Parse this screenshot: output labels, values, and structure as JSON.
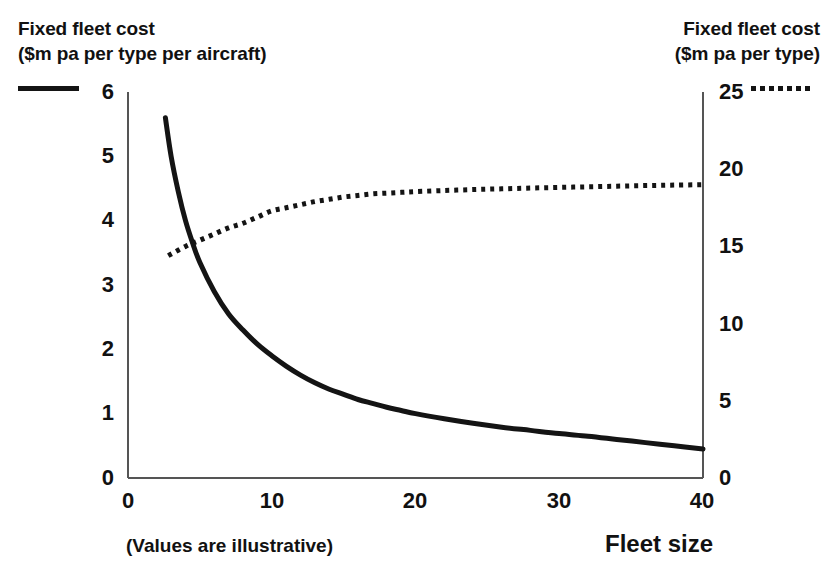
{
  "chart_data": {
    "type": "line",
    "title": "",
    "subtitle": "",
    "note": "(Values are illustrative)",
    "xlabel": "Fleet size",
    "xlim": [
      0,
      40
    ],
    "xticks": [
      0,
      10,
      20,
      30,
      40
    ],
    "grid": false,
    "legend_position": "top-outside",
    "axes": [
      {
        "id": "left",
        "side": "left",
        "label_line1": "Fixed fleet cost",
        "label_line2": "($m pa per type per aircraft)",
        "ylim": [
          0,
          6
        ],
        "yticks": [
          0,
          1,
          2,
          3,
          4,
          5,
          6
        ]
      },
      {
        "id": "right",
        "side": "right",
        "label_line1": "Fixed fleet cost",
        "label_line2": "($m pa per type)",
        "ylim": [
          0,
          25
        ],
        "yticks": [
          0,
          5,
          10,
          15,
          20,
          25
        ]
      }
    ],
    "series": [
      {
        "name": "Fixed fleet cost ($m pa per type per aircraft)",
        "axis": "left",
        "style": "solid",
        "color": "#141414",
        "x": [
          2.6,
          3,
          3.5,
          4,
          4.5,
          5,
          6,
          7,
          8,
          9,
          10,
          11,
          12,
          13,
          14,
          15,
          16,
          17,
          18,
          19,
          20,
          22,
          24,
          26,
          28,
          30,
          32,
          34,
          36,
          38,
          40
        ],
        "y": [
          5.6,
          5.0,
          4.45,
          4.0,
          3.65,
          3.35,
          2.9,
          2.55,
          2.3,
          2.08,
          1.9,
          1.74,
          1.6,
          1.48,
          1.38,
          1.3,
          1.22,
          1.16,
          1.1,
          1.05,
          1.0,
          0.92,
          0.85,
          0.79,
          0.74,
          0.69,
          0.65,
          0.6,
          0.55,
          0.5,
          0.45
        ]
      },
      {
        "name": "Fixed fleet cost ($m pa per type)",
        "axis": "right",
        "style": "dotted",
        "color": "#141414",
        "x": [
          2.8,
          4,
          5,
          6,
          7,
          8,
          9,
          10,
          11,
          12,
          13,
          14,
          15,
          16,
          17,
          18,
          19,
          20,
          22,
          24,
          26,
          28,
          30,
          32,
          34,
          36,
          38,
          40
        ],
        "y": [
          14.4,
          15.0,
          15.4,
          15.8,
          16.2,
          16.5,
          16.9,
          17.3,
          17.5,
          17.7,
          17.9,
          18.05,
          18.2,
          18.3,
          18.4,
          18.45,
          18.5,
          18.55,
          18.62,
          18.68,
          18.73,
          18.78,
          18.82,
          18.86,
          18.9,
          18.94,
          18.97,
          19.0
        ]
      }
    ]
  },
  "legend": {
    "solid_swatch": "solid-line-swatch",
    "dotted_swatch": "dotted-line-swatch"
  },
  "left_axis": {
    "title_line1": "Fixed fleet cost",
    "title_line2": "($m pa per type per aircraft)",
    "ticks": [
      "6",
      "5",
      "4",
      "3",
      "2",
      "1",
      "0"
    ]
  },
  "right_axis": {
    "title_line1": "Fixed fleet cost",
    "title_line2": "($m pa per type)",
    "ticks": [
      "25",
      "20",
      "15",
      "10",
      "5",
      "0"
    ]
  },
  "x_axis": {
    "title": "Fleet size",
    "ticks": [
      "0",
      "10",
      "20",
      "30",
      "40"
    ]
  },
  "footer": {
    "note": "(Values are illustrative)"
  },
  "colors": {
    "ink": "#141414",
    "axis": "#555555",
    "background": "#ffffff"
  }
}
